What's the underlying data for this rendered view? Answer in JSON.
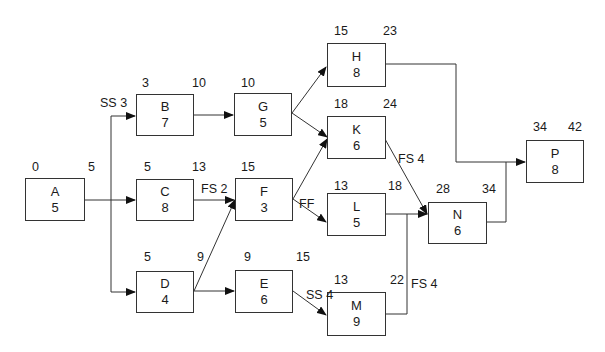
{
  "nodes": {
    "A": {
      "name": "A",
      "duration": "5",
      "es": "0",
      "ef": "5"
    },
    "B": {
      "name": "B",
      "duration": "7",
      "es": "3",
      "ef": "10"
    },
    "C": {
      "name": "C",
      "duration": "8",
      "es": "5",
      "ef": "13"
    },
    "D": {
      "name": "D",
      "duration": "4",
      "es": "5",
      "ef": "9"
    },
    "G": {
      "name": "G",
      "duration": "5",
      "es": "10",
      "ef": "15"
    },
    "F": {
      "name": "F",
      "duration": "3",
      "es": "15",
      "ef": "18"
    },
    "E": {
      "name": "E",
      "duration": "6",
      "es": "9",
      "ef": "15"
    },
    "H": {
      "name": "H",
      "duration": "8",
      "es": "15",
      "ef": "23"
    },
    "K": {
      "name": "K",
      "duration": "6",
      "es": "18",
      "ef": "24"
    },
    "L": {
      "name": "L",
      "duration": "5",
      "es": "13",
      "ef": "18"
    },
    "M": {
      "name": "M",
      "duration": "9",
      "es": "13",
      "ef": "22"
    },
    "N": {
      "name": "N",
      "duration": "6",
      "es": "28",
      "ef": "34"
    },
    "P": {
      "name": "P",
      "duration": "8",
      "es": "34",
      "ef": "42"
    }
  },
  "links": {
    "a_b": "SS 3",
    "c_f": "FS 2",
    "f_l": "FF",
    "e_m": "SS 4",
    "k_n": "FS 4",
    "m_n": "FS 4"
  }
}
